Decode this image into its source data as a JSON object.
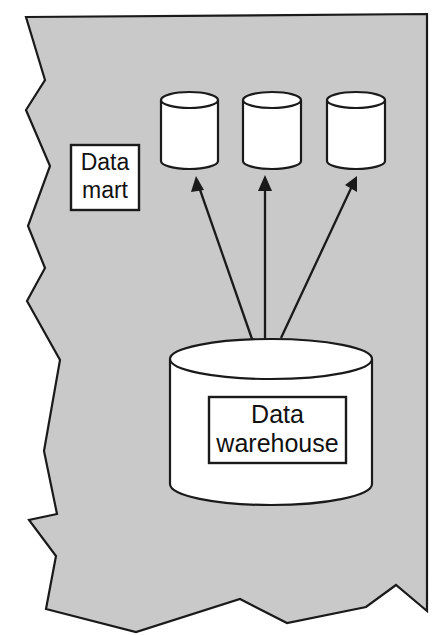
{
  "figure": {
    "background_color": "#ffffff",
    "sheet_color": "#c9c9c9",
    "outline_color": "#1a1a1a",
    "shape_fill_color": "#ffffff"
  },
  "labels": {
    "data_mart": {
      "line1": "Data",
      "line2": "mart"
    },
    "data_warehouse": {
      "line1": "Data",
      "line2": "warehouse"
    }
  },
  "nodes": {
    "data_marts": [
      {
        "id": "data-mart-1",
        "name": "data-mart-cylinder-1"
      },
      {
        "id": "data-mart-2",
        "name": "data-mart-cylinder-2"
      },
      {
        "id": "data-mart-3",
        "name": "data-mart-cylinder-3"
      }
    ],
    "data_warehouse": {
      "id": "data-warehouse",
      "name": "data-warehouse-cylinder"
    }
  },
  "connections": [
    {
      "from": "data-warehouse",
      "to": "data-mart-1",
      "direction": "up-left"
    },
    {
      "from": "data-warehouse",
      "to": "data-mart-2",
      "direction": "up"
    },
    {
      "from": "data-warehouse",
      "to": "data-mart-3",
      "direction": "up-right"
    }
  ]
}
